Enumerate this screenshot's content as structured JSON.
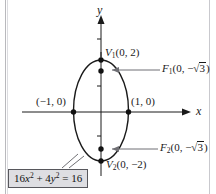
{
  "figure": {
    "axes": {
      "x_label": "x",
      "y_label": "y",
      "x_axis_y_pixel": 112,
      "y_axis_x_pixel": 101
    },
    "equation_box": {
      "full_text": "16x2 + 4y2 = 16",
      "coef_x": "16",
      "var_x": "x",
      "exp_x": "2",
      "plus": "+",
      "coef_y": "4",
      "var_y": "y",
      "exp_y": "2",
      "equals": "=",
      "rhs": "16"
    },
    "points": [
      {
        "name": "vertex-1",
        "label_prefix": "V",
        "label_sub": "1",
        "label_coords": "(0, 2)",
        "x": 0,
        "y": 2
      },
      {
        "name": "focus-1",
        "label_prefix": "F",
        "label_sub": "1",
        "label_open": "(0, −",
        "label_radicand": "3",
        "label_close": ")",
        "x": 0,
        "y": 1.732
      },
      {
        "name": "x-intercept-left",
        "label_coords": "(−1, 0)",
        "x": -1,
        "y": 0
      },
      {
        "name": "x-intercept-right",
        "label_coords": "(1, 0)",
        "x": 1,
        "y": 0
      },
      {
        "name": "focus-2",
        "label_prefix": "F",
        "label_sub": "2",
        "label_open": "(0, −",
        "label_radicand": "3",
        "label_close": ")",
        "x": 0,
        "y": -1.732
      },
      {
        "name": "vertex-2",
        "label_prefix": "V",
        "label_sub": "2",
        "label_coords": "(0, −2)",
        "x": 0,
        "y": -2
      }
    ],
    "colors": {
      "stroke": "#1a1a1a",
      "box_fill": "#dedee2",
      "box_border": "#57575c",
      "leader": "#6f6f74",
      "background": "#ffffff"
    }
  }
}
